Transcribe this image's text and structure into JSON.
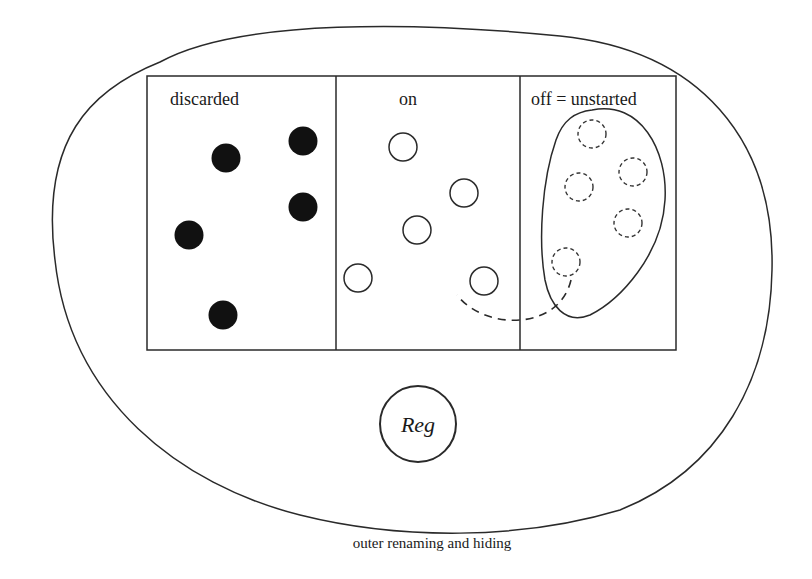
{
  "diagram": {
    "outer_region": {
      "caption": "outer renaming and hiding"
    },
    "compartments": [
      {
        "label": "discarded",
        "token_style": "filled"
      },
      {
        "label": "on",
        "token_style": "hollow"
      },
      {
        "label": "off = unstarted",
        "token_style": "dashed"
      }
    ],
    "register": {
      "label": "Reg"
    },
    "colors": {
      "stroke": "#2a2a2a",
      "token_fill": "#111111",
      "background": "#ffffff"
    }
  }
}
